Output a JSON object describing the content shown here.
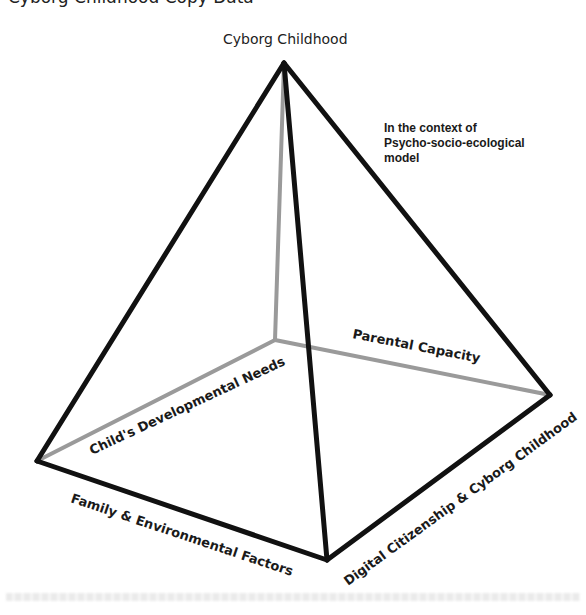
{
  "header": {
    "cutoff_line": "Cyborg Childhood Copy Data"
  },
  "diagram": {
    "type": "pyramid",
    "apex_label": "Cyborg Childhood",
    "context_note": [
      "In the context of",
      "Psycho-socio-ecological",
      "model"
    ],
    "edges": {
      "back_left": "Child's Developmental Needs",
      "back_right": "Parental Capacity",
      "front_left": "Family & Environmental Factors",
      "front_right": "Digital Citizenship & Cyborg Childhood"
    },
    "colors": {
      "visible_edge": "#111111",
      "hidden_edge": "#9a9a9a",
      "text": "#1a1a1a"
    }
  }
}
